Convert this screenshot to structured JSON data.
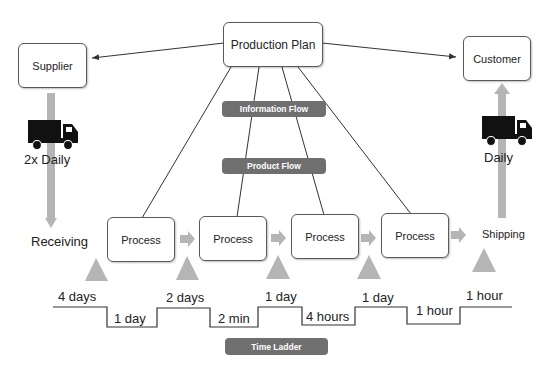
{
  "nodes": {
    "production_plan": "Production Plan",
    "supplier": "Supplier",
    "customer": "Customer",
    "processes": [
      "Process",
      "Process",
      "Process",
      "Process"
    ]
  },
  "labels": {
    "inbound_frequency": "2x Daily",
    "outbound_frequency": "Daily",
    "receiving": "Receiving",
    "shipping": "Shipping"
  },
  "tags": {
    "information_flow": "Information Flow",
    "product_flow": "Product Flow",
    "time_ladder": "Time Ladder"
  },
  "time_ladder": {
    "inventory_times": [
      "4 days",
      "2 days",
      "1 day",
      "1 day",
      "1 hour"
    ],
    "process_times": [
      "1 day",
      "2 min",
      "4 hours",
      "1 hour"
    ]
  },
  "colors": {
    "tag_bg": "#6f6f6f",
    "arrow_gray": "#b5b5b5",
    "line": "#333333"
  }
}
